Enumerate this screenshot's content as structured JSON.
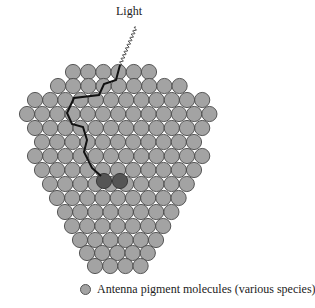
{
  "figure": {
    "light_label": "Light",
    "legend": {
      "label": "Antenna pigment molecules (various species)"
    },
    "colors": {
      "pigment_fill": "#a3a3a3",
      "pigment_stroke": "#4a4a4a",
      "reaction_center_fill": "#555555",
      "path_stroke": "#111111"
    },
    "circle_radius": 7.6,
    "circle_pitch": 15.2,
    "rows": [
      {
        "y": 72,
        "x0": 73,
        "count": 6
      },
      {
        "y": 86,
        "x0": 58,
        "count": 9
      },
      {
        "y": 100,
        "x0": 35,
        "count": 12
      },
      {
        "y": 114,
        "x0": 27,
        "count": 13
      },
      {
        "y": 128,
        "x0": 35,
        "count": 12
      },
      {
        "y": 142,
        "x0": 42,
        "count": 11
      },
      {
        "y": 156,
        "x0": 35,
        "count": 12
      },
      {
        "y": 170,
        "x0": 42,
        "count": 11
      },
      {
        "y": 184,
        "x0": 50,
        "count": 10
      },
      {
        "y": 198,
        "x0": 57,
        "count": 9
      },
      {
        "y": 212,
        "x0": 65,
        "count": 8
      },
      {
        "y": 226,
        "x0": 72,
        "count": 7
      },
      {
        "y": 240,
        "x0": 80,
        "count": 6
      },
      {
        "y": 253,
        "x0": 87,
        "count": 5
      },
      {
        "y": 266,
        "x0": 95,
        "count": 4
      }
    ],
    "reaction_center": [
      {
        "x": 104,
        "y": 181
      },
      {
        "x": 120,
        "y": 181
      }
    ],
    "light_wave": {
      "x1": 136,
      "y1": 27,
      "x2": 120,
      "y2": 65
    },
    "energy_path": [
      [
        120,
        65
      ],
      [
        116,
        80
      ],
      [
        104,
        84
      ],
      [
        99,
        95
      ],
      [
        74,
        98
      ],
      [
        67,
        113
      ],
      [
        72,
        124
      ],
      [
        83,
        127
      ],
      [
        87,
        140
      ],
      [
        84,
        152
      ],
      [
        92,
        168
      ],
      [
        101,
        176
      ]
    ]
  }
}
